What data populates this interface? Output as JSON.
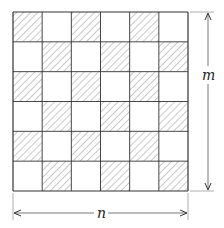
{
  "diagram": {
    "type": "checkerboard-grid",
    "rows": 6,
    "cols": 6,
    "hatched_rule": "(row+col) even",
    "hatched_cells": [
      [
        0,
        0
      ],
      [
        0,
        2
      ],
      [
        0,
        4
      ],
      [
        1,
        1
      ],
      [
        1,
        3
      ],
      [
        1,
        5
      ],
      [
        2,
        0
      ],
      [
        2,
        2
      ],
      [
        2,
        4
      ],
      [
        3,
        1
      ],
      [
        3,
        3
      ],
      [
        3,
        5
      ],
      [
        4,
        0
      ],
      [
        4,
        2
      ],
      [
        4,
        4
      ],
      [
        5,
        1
      ],
      [
        5,
        3
      ],
      [
        5,
        5
      ]
    ],
    "colors": {
      "line": "#333333",
      "hatch": "#777777",
      "background": "#ffffff"
    }
  },
  "dimensions": {
    "height_label": "m",
    "width_label": "n"
  }
}
